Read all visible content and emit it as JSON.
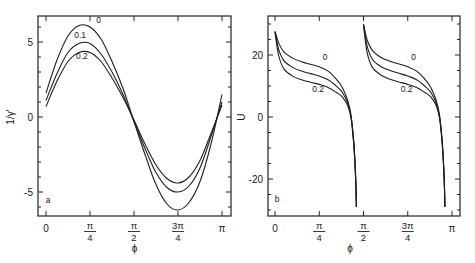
{
  "chart_data": [
    {
      "panel": "a",
      "type": "line",
      "title": "",
      "xlabel": "ϕ",
      "ylabel": "1/γ'",
      "xlim": [
        0,
        3.1416
      ],
      "ylim": [
        -6.6,
        6.7
      ],
      "grid": false,
      "x_ticks": [
        {
          "value": 0,
          "label": "0"
        },
        {
          "value": 0.7854,
          "label_num": "π",
          "label_den": "4"
        },
        {
          "value": 1.5708,
          "label_num": "π",
          "label_den": "2"
        },
        {
          "value": 2.3562,
          "label_num": "3π",
          "label_den": "4"
        },
        {
          "value": 3.1416,
          "label": "π"
        }
      ],
      "y_ticks": [
        {
          "value": 5,
          "label": "5"
        },
        {
          "value": 0,
          "label": "0"
        },
        {
          "value": -5,
          "label": "-5"
        }
      ],
      "x_over_pi": [
        0,
        0.0625,
        0.125,
        0.1875,
        0.25,
        0.3125,
        0.375,
        0.4375,
        0.5,
        0.5625,
        0.625,
        0.6875,
        0.75,
        0.8125,
        0.875,
        0.9375,
        1.0
      ],
      "series": [
        {
          "name": "0",
          "values": [
            1.6,
            3.8,
            5.4,
            6.1,
            6.0,
            5.2,
            3.7,
            1.9,
            -0.3,
            -2.5,
            -4.5,
            -5.8,
            -6.2,
            -5.7,
            -4.3,
            -1.8,
            1.5
          ],
          "label_at": [
            0.285,
            6.3
          ]
        },
        {
          "name": "0.1",
          "values": [
            1.1,
            2.9,
            4.3,
            4.9,
            4.9,
            4.2,
            3.0,
            1.5,
            -0.3,
            -2.1,
            -3.7,
            -4.7,
            -5.0,
            -4.6,
            -3.4,
            -1.3,
            1.0
          ],
          "label_at": [
            0.16,
            5.3
          ]
        },
        {
          "name": "0.2",
          "values": [
            0.7,
            2.4,
            3.7,
            4.3,
            4.3,
            3.7,
            2.6,
            1.3,
            -0.2,
            -1.8,
            -3.2,
            -4.1,
            -4.4,
            -4.0,
            -2.9,
            -1.1,
            0.8
          ],
          "label_at": [
            0.17,
            3.9
          ]
        }
      ],
      "annotations": [
        {
          "text": "a",
          "x_over_pi": 0.01,
          "y": -5.7
        }
      ]
    },
    {
      "panel": "b",
      "type": "line",
      "title": "",
      "xlabel": "ϕ",
      "ylabel": "U",
      "xlim": [
        0,
        3.1416
      ],
      "ylim": [
        -32,
        32
      ],
      "grid": false,
      "x_ticks": [
        {
          "value": 0,
          "label": "0"
        },
        {
          "value": 0.7854,
          "label_num": "π",
          "label_den": "4"
        },
        {
          "value": 1.5708,
          "label_num": "π",
          "label_den": "2"
        },
        {
          "value": 2.3562,
          "label_num": "3π",
          "label_den": "4"
        },
        {
          "value": 3.1416,
          "label": "π"
        }
      ],
      "y_ticks": [
        {
          "value": 20,
          "label": "20"
        },
        {
          "value": 0,
          "label": "0"
        },
        {
          "value": -20,
          "label": "-20"
        }
      ],
      "branch_x_over_pi": [
        0.0,
        0.02,
        0.05,
        0.1,
        0.15,
        0.2,
        0.25,
        0.3,
        0.35,
        0.38,
        0.41,
        0.43,
        0.445,
        0.455,
        0.46
      ],
      "branches": [
        {
          "offset_over_pi": 0.0,
          "series": [
            {
              "name": "0",
              "values": [
                27.7,
                24.0,
                21.0,
                19.0,
                17.8,
                17.0,
                16.2,
                14.8,
                12.0,
                9.5,
                5.5,
                0.5,
                -8.0,
                -18.0,
                -29.0
              ]
            },
            {
              "name": "0.1",
              "values": [
                27.5,
                22.0,
                18.2,
                16.0,
                14.8,
                14.0,
                13.2,
                12.0,
                9.8,
                8.0,
                4.5,
                0.0,
                -8.5,
                -18.5,
                -29.0
              ]
            },
            {
              "name": "0.2",
              "values": [
                27.3,
                20.0,
                15.5,
                13.2,
                12.0,
                11.2,
                10.5,
                9.5,
                7.8,
                6.5,
                3.8,
                -0.5,
                -9.0,
                -19.0,
                -29.0
              ]
            }
          ]
        },
        {
          "offset_over_pi": 0.5,
          "series": [
            {
              "name": "0",
              "values": [
                30.0,
                25.0,
                21.5,
                19.2,
                18.0,
                17.1,
                16.2,
                14.8,
                12.0,
                9.5,
                5.5,
                0.5,
                -8.0,
                -18.0,
                -29.0
              ]
            },
            {
              "name": "0.1",
              "values": [
                29.8,
                23.0,
                18.6,
                16.2,
                15.0,
                14.1,
                13.2,
                12.0,
                9.8,
                8.0,
                4.5,
                0.0,
                -8.5,
                -18.5,
                -29.0
              ]
            },
            {
              "name": "0.2",
              "values": [
                29.6,
                21.0,
                16.0,
                13.5,
                12.2,
                11.3,
                10.5,
                9.5,
                7.8,
                6.5,
                3.8,
                -0.5,
                -9.0,
                -19.0,
                -29.0
              ]
            }
          ]
        }
      ],
      "curve_labels": [
        {
          "text": "0",
          "x_over_pi": 0.27,
          "y": 18.5
        },
        {
          "text": "0.2",
          "x_over_pi": 0.21,
          "y": 8.0
        },
        {
          "text": "0",
          "x_over_pi": 0.77,
          "y": 18.5
        },
        {
          "text": "0.2",
          "x_over_pi": 0.71,
          "y": 8.0
        }
      ],
      "annotations": [
        {
          "text": "b",
          "x_over_pi": 0.01,
          "y": -27.5
        }
      ]
    }
  ]
}
